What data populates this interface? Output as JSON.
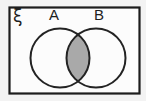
{
  "diagram": {
    "universal_set": {
      "label": "ξ"
    },
    "sets": [
      {
        "label": "A"
      },
      {
        "label": "B"
      }
    ],
    "shaded_region": "intersection-of-A-and-B",
    "colors": {
      "outline": "#1c1c1c",
      "shading": "#a9a9a9",
      "panel_background": "#fcfcfc",
      "page_background": "#f3f3f3"
    }
  }
}
